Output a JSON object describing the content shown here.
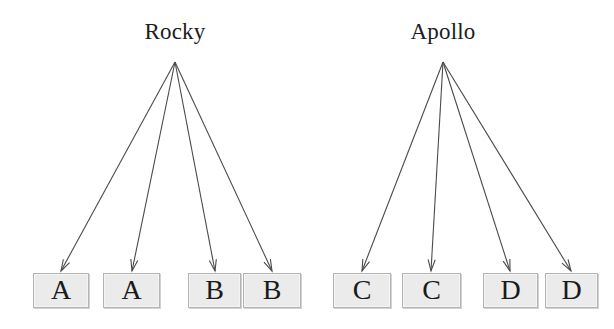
{
  "diagram": {
    "type": "inheritance-fan-diagram",
    "title": "",
    "canvas": {
      "width": 614,
      "height": 329,
      "background": "#ffffff"
    },
    "style": {
      "box_fill": "#ebebeb",
      "box_border": "#b4b4b4",
      "arrow_color": "#4a4a4a",
      "text_color": "#1c1c1c"
    },
    "parents": [
      {
        "id": "rocky",
        "label": "Rocky",
        "center_x": 175,
        "label_y": 18,
        "apex_x": 175,
        "apex_y": 62
      },
      {
        "id": "apollo",
        "label": "Apollo",
        "center_x": 443,
        "label_y": 18,
        "apex_x": 443,
        "apex_y": 62
      }
    ],
    "children": [
      {
        "id": "child-1",
        "label": "A",
        "parent": "rocky",
        "x": 33,
        "y": 273,
        "width": 56,
        "height": 35
      },
      {
        "id": "child-2",
        "label": "A",
        "parent": "rocky",
        "x": 103,
        "y": 273,
        "width": 57,
        "height": 35
      },
      {
        "id": "child-3",
        "label": "B",
        "parent": "rocky",
        "x": 188,
        "y": 273,
        "width": 53,
        "height": 35
      },
      {
        "id": "child-4",
        "label": "B",
        "parent": "rocky",
        "x": 243,
        "y": 273,
        "width": 58,
        "height": 35
      },
      {
        "id": "child-5",
        "label": "C",
        "parent": "apollo",
        "x": 333,
        "y": 273,
        "width": 58,
        "height": 35
      },
      {
        "id": "child-6",
        "label": "C",
        "parent": "apollo",
        "x": 402,
        "y": 273,
        "width": 59,
        "height": 35
      },
      {
        "id": "child-7",
        "label": "D",
        "parent": "apollo",
        "x": 483,
        "y": 273,
        "width": 55,
        "height": 35
      },
      {
        "id": "child-8",
        "label": "D",
        "parent": "apollo",
        "x": 545,
        "y": 273,
        "width": 53,
        "height": 35
      }
    ],
    "edges": [
      {
        "id": "edge-rocky-a1",
        "from": "rocky",
        "to": "child-1",
        "x1": 175,
        "y1": 62,
        "x2": 61,
        "y2": 271
      },
      {
        "id": "edge-rocky-a2",
        "from": "rocky",
        "to": "child-2",
        "x1": 175,
        "y1": 62,
        "x2": 132,
        "y2": 271
      },
      {
        "id": "edge-rocky-b1",
        "from": "rocky",
        "to": "child-3",
        "x1": 175,
        "y1": 62,
        "x2": 215,
        "y2": 271
      },
      {
        "id": "edge-rocky-b2",
        "from": "rocky",
        "to": "child-4",
        "x1": 175,
        "y1": 62,
        "x2": 272,
        "y2": 271
      },
      {
        "id": "edge-apollo-c1",
        "from": "apollo",
        "to": "child-5",
        "x1": 443,
        "y1": 62,
        "x2": 362,
        "y2": 271
      },
      {
        "id": "edge-apollo-c2",
        "from": "apollo",
        "to": "child-6",
        "x1": 443,
        "y1": 62,
        "x2": 431,
        "y2": 271
      },
      {
        "id": "edge-apollo-d1",
        "from": "apollo",
        "to": "child-7",
        "x1": 443,
        "y1": 62,
        "x2": 510,
        "y2": 271
      },
      {
        "id": "edge-apollo-d2",
        "from": "apollo",
        "to": "child-8",
        "x1": 443,
        "y1": 62,
        "x2": 571,
        "y2": 271
      }
    ]
  }
}
